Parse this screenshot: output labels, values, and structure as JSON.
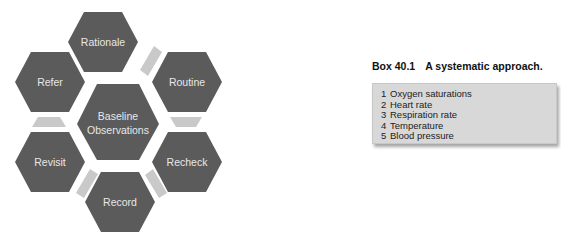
{
  "diagram": {
    "center": {
      "line1": "Baseline",
      "line2": "Observations"
    },
    "hexagons": [
      {
        "label": "Rationale"
      },
      {
        "label": "Routine"
      },
      {
        "label": "Recheck"
      },
      {
        "label": "Record"
      },
      {
        "label": "Revisit"
      },
      {
        "label": "Refer"
      }
    ],
    "colors": {
      "hexagon": "#5b5b5b",
      "connector": "#c9c9c9",
      "text": "#e8e8e8"
    }
  },
  "box": {
    "number": "Box 40.1",
    "title": "A systematic approach.",
    "items": [
      {
        "n": "1",
        "text": "Oxygen saturations"
      },
      {
        "n": "2",
        "text": "Heart rate"
      },
      {
        "n": "3",
        "text": "Respiration rate"
      },
      {
        "n": "4",
        "text": "Temperature"
      },
      {
        "n": "5",
        "text": "Blood pressure"
      }
    ]
  }
}
